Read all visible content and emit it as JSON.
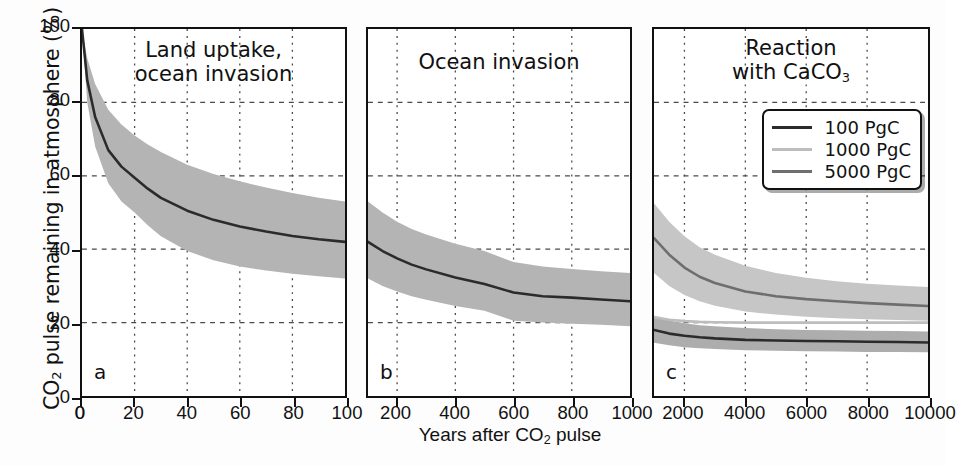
{
  "figure": {
    "ylabel_main": "CO",
    "ylabel_sub": "2",
    "ylabel_rest": " pulse remaining in atmosphere (%)",
    "xlabel_main": "Years after CO",
    "xlabel_sub": "2",
    "xlabel_rest": " pulse",
    "ylim": [
      0,
      100
    ],
    "yticks": [
      "0",
      "20",
      "40",
      "60",
      "80",
      "100"
    ]
  },
  "panels": [
    {
      "letter": "a",
      "title_line1": "Land uptake,",
      "title_line2": "ocean invasion",
      "xticks": [
        "0",
        "20",
        "40",
        "60",
        "80",
        "100"
      ],
      "xlim": [
        0,
        100
      ]
    },
    {
      "letter": "b",
      "title_line1": "Ocean invasion",
      "title_line2": "",
      "xticks": [
        "200",
        "400",
        "600",
        "800",
        "1000"
      ],
      "xlim": [
        100,
        1000
      ]
    },
    {
      "letter": "c",
      "title_line1": "Reaction",
      "title_line2": "with CaCO",
      "title_sub": "3",
      "xticks": [
        "2000",
        "4000",
        "6000",
        "8000",
        "10000"
      ],
      "xlim": [
        1000,
        10000
      ]
    }
  ],
  "legend": {
    "position": "panel-c-top-right",
    "items": [
      {
        "label": "100 PgC",
        "color": "#2b2b2b"
      },
      {
        "label": "1000 PgC",
        "color": "#bdbdbd"
      },
      {
        "label": "5000 PgC",
        "color": "#6e6e6e"
      }
    ]
  },
  "colors": {
    "line_dark": "#2b2b2b",
    "line_mid": "#6e6e6e",
    "line_light": "#bdbdbd",
    "band_fill": "#b4b4b4",
    "band_fill_light": "#d2d2d2",
    "axis": "#111111",
    "grid": "#4a4a4a",
    "background": "#ffffff"
  },
  "chart_data": {
    "type": "line",
    "xlabel": "Years after CO2 pulse",
    "ylabel": "CO2 pulse remaining in atmosphere (%)",
    "ylim": [
      0,
      100
    ],
    "grid": true,
    "legend": [
      "100 PgC",
      "1000 PgC",
      "5000 PgC"
    ],
    "panels": [
      {
        "label": "a",
        "title": "Land uptake, ocean invasion",
        "xlim": [
          0,
          100
        ],
        "xticks": [
          0,
          20,
          40,
          60,
          80,
          100
        ],
        "yticks": [
          0,
          20,
          40,
          60,
          80,
          100
        ],
        "series": [
          {
            "name": "multi-model mean",
            "color": "#2b2b2b",
            "x": [
              0,
              2,
              5,
              10,
              15,
              20,
              25,
              30,
              40,
              50,
              60,
              70,
              80,
              90,
              100
            ],
            "y": [
              100,
              86,
              76,
              67,
              62.5,
              59.5,
              56.5,
              54,
              50.5,
              48,
              46.2,
              44.8,
              43.6,
              42.7,
              42.0
            ]
          }
        ],
        "band": {
          "name": "model spread",
          "color": "#b4b4b4",
          "x": [
            0,
            2,
            5,
            10,
            15,
            20,
            25,
            30,
            40,
            50,
            60,
            70,
            80,
            90,
            100
          ],
          "ylow": [
            100,
            80,
            68,
            58,
            53,
            50,
            46.5,
            43.5,
            39.5,
            37,
            35.3,
            34.2,
            33.3,
            32.6,
            32.0
          ],
          "yhigh": [
            100,
            92,
            85,
            78,
            74,
            71,
            68.5,
            66.5,
            63,
            60.5,
            58.5,
            56.8,
            55.3,
            54.0,
            53.0
          ]
        }
      },
      {
        "label": "b",
        "title": "Ocean invasion",
        "xlim": [
          100,
          1000
        ],
        "xticks": [
          200,
          400,
          600,
          800,
          1000
        ],
        "yticks": [
          0,
          20,
          40,
          60,
          80,
          100
        ],
        "series": [
          {
            "name": "multi-model mean",
            "color": "#2b2b2b",
            "x": [
              100,
              150,
              200,
              250,
              300,
              400,
              500,
              600,
              700,
              800,
              900,
              1000
            ],
            "y": [
              42.0,
              39.5,
              37.5,
              35.8,
              34.5,
              32.3,
              30.5,
              28.2,
              27.2,
              26.8,
              26.3,
              25.8
            ]
          }
        ],
        "band": {
          "name": "model spread",
          "color": "#b4b4b4",
          "x": [
            100,
            150,
            200,
            250,
            300,
            400,
            500,
            600,
            700,
            800,
            900,
            1000
          ],
          "ylow": [
            32.0,
            30.0,
            28.5,
            27.2,
            26.2,
            24.5,
            23.2,
            20.5,
            20.0,
            19.7,
            19.4,
            19.0
          ],
          "yhigh": [
            53.0,
            50.0,
            47.5,
            45.5,
            44.0,
            41.5,
            39.5,
            36.5,
            35.3,
            34.6,
            34.0,
            33.5
          ]
        }
      },
      {
        "label": "c",
        "title": "Reaction with CaCO3",
        "xlim": [
          1000,
          10000
        ],
        "xticks": [
          2000,
          4000,
          6000,
          8000,
          10000
        ],
        "yticks": [
          0,
          20,
          40,
          60,
          80,
          100
        ],
        "series": [
          {
            "name": "5000 PgC",
            "color": "#6e6e6e",
            "x": [
              1000,
              1500,
              2000,
              2500,
              3000,
              4000,
              5000,
              6000,
              7000,
              8000,
              9000,
              10000
            ],
            "y": [
              43.0,
              38.5,
              35.0,
              32.5,
              30.8,
              28.5,
              27.2,
              26.4,
              25.8,
              25.3,
              24.9,
              24.5
            ]
          },
          {
            "name": "1000 PgC",
            "color": "#bdbdbd",
            "x": [
              1000,
              1500,
              2000,
              2500,
              3000,
              4000,
              5000,
              6000,
              7000,
              8000,
              9000,
              10000
            ],
            "y": [
              21.5,
              20.8,
              20.4,
              20.2,
              20.1,
              20.0,
              20.0,
              20.0,
              20.0,
              20.0,
              20.0,
              20.0
            ]
          },
          {
            "name": "100 PgC",
            "color": "#2b2b2b",
            "x": [
              1000,
              1500,
              2000,
              2500,
              3000,
              4000,
              5000,
              6000,
              7000,
              8000,
              9000,
              10000
            ],
            "y": [
              18.0,
              17.0,
              16.4,
              16.0,
              15.7,
              15.3,
              15.1,
              15.0,
              14.9,
              14.8,
              14.7,
              14.6
            ]
          }
        ],
        "bands": [
          {
            "name": "5000 PgC spread",
            "color": "#c6c6c6",
            "x": [
              1000,
              1500,
              2000,
              2500,
              3000,
              4000,
              5000,
              6000,
              7000,
              8000,
              9000,
              10000
            ],
            "ylow": [
              33.5,
              30.0,
              27.5,
              25.8,
              24.6,
              23.0,
              22.2,
              21.6,
              21.2,
              20.9,
              20.7,
              20.5
            ],
            "yhigh": [
              52.5,
              47.5,
              43.5,
              40.5,
              38.5,
              35.5,
              33.5,
              32.2,
              31.3,
              30.6,
              30.1,
              29.7
            ]
          },
          {
            "name": "100 PgC spread",
            "color": "#adadad",
            "x": [
              1000,
              1500,
              2000,
              2500,
              3000,
              4000,
              5000,
              6000,
              7000,
              8000,
              9000,
              10000
            ],
            "ylow": [
              14.5,
              13.8,
              13.3,
              13.0,
              12.8,
              12.5,
              12.3,
              12.2,
              12.1,
              12.0,
              12.0,
              11.9
            ],
            "yhigh": [
              21.8,
              20.6,
              19.8,
              19.3,
              19.0,
              18.5,
              18.2,
              18.0,
              17.9,
              17.8,
              17.7,
              17.6
            ]
          }
        ]
      }
    ]
  }
}
